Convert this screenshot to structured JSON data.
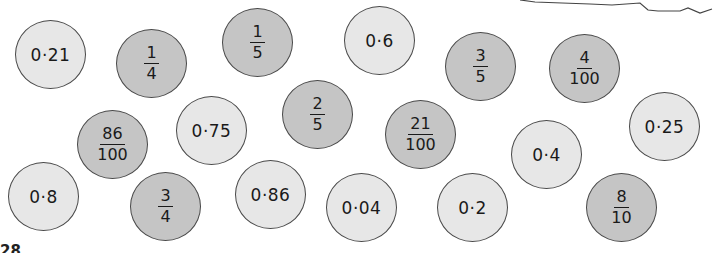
{
  "cards": [
    {
      "type": "decimal",
      "value": "0·21",
      "shade": "light",
      "x": 15,
      "y": 20
    },
    {
      "type": "fraction",
      "num": "1",
      "den": "4",
      "shade": "dark",
      "x": 116,
      "y": 29
    },
    {
      "type": "fraction",
      "num": "1",
      "den": "5",
      "shade": "dark",
      "x": 222,
      "y": 8
    },
    {
      "type": "decimal",
      "value": "0·6",
      "shade": "light",
      "x": 344,
      "y": 6
    },
    {
      "type": "fraction",
      "num": "3",
      "den": "5",
      "shade": "dark",
      "x": 445,
      "y": 32
    },
    {
      "type": "fraction",
      "num": "4",
      "den": "100",
      "shade": "dark",
      "x": 549,
      "y": 34
    },
    {
      "type": "fraction",
      "num": "86",
      "den": "100",
      "shade": "dark",
      "x": 77,
      "y": 110
    },
    {
      "type": "decimal",
      "value": "0·75",
      "shade": "light",
      "x": 176,
      "y": 96
    },
    {
      "type": "fraction",
      "num": "2",
      "den": "5",
      "shade": "dark",
      "x": 282,
      "y": 80
    },
    {
      "type": "fraction",
      "num": "21",
      "den": "100",
      "shade": "dark",
      "x": 385,
      "y": 100
    },
    {
      "type": "decimal",
      "value": "0·4",
      "shade": "light",
      "x": 511,
      "y": 120
    },
    {
      "type": "decimal",
      "value": "0·25",
      "shade": "light",
      "x": 629,
      "y": 92
    },
    {
      "type": "decimal",
      "value": "0·8",
      "shade": "light",
      "x": 8,
      "y": 162
    },
    {
      "type": "fraction",
      "num": "3",
      "den": "4",
      "shade": "dark",
      "x": 130,
      "y": 172
    },
    {
      "type": "decimal",
      "value": "0·86",
      "shade": "light",
      "x": 235,
      "y": 160
    },
    {
      "type": "decimal",
      "value": "0·04",
      "shade": "light",
      "x": 326,
      "y": 173
    },
    {
      "type": "decimal",
      "value": "0·2",
      "shade": "light",
      "x": 437,
      "y": 173
    },
    {
      "type": "fraction",
      "num": "8",
      "den": "10",
      "shade": "dark",
      "x": 586,
      "y": 173
    }
  ],
  "colors": {
    "light_card": "#e7e7e7",
    "dark_card": "#c5c5c5",
    "outline": "#4a4a4a"
  },
  "cutoff_text": "28"
}
